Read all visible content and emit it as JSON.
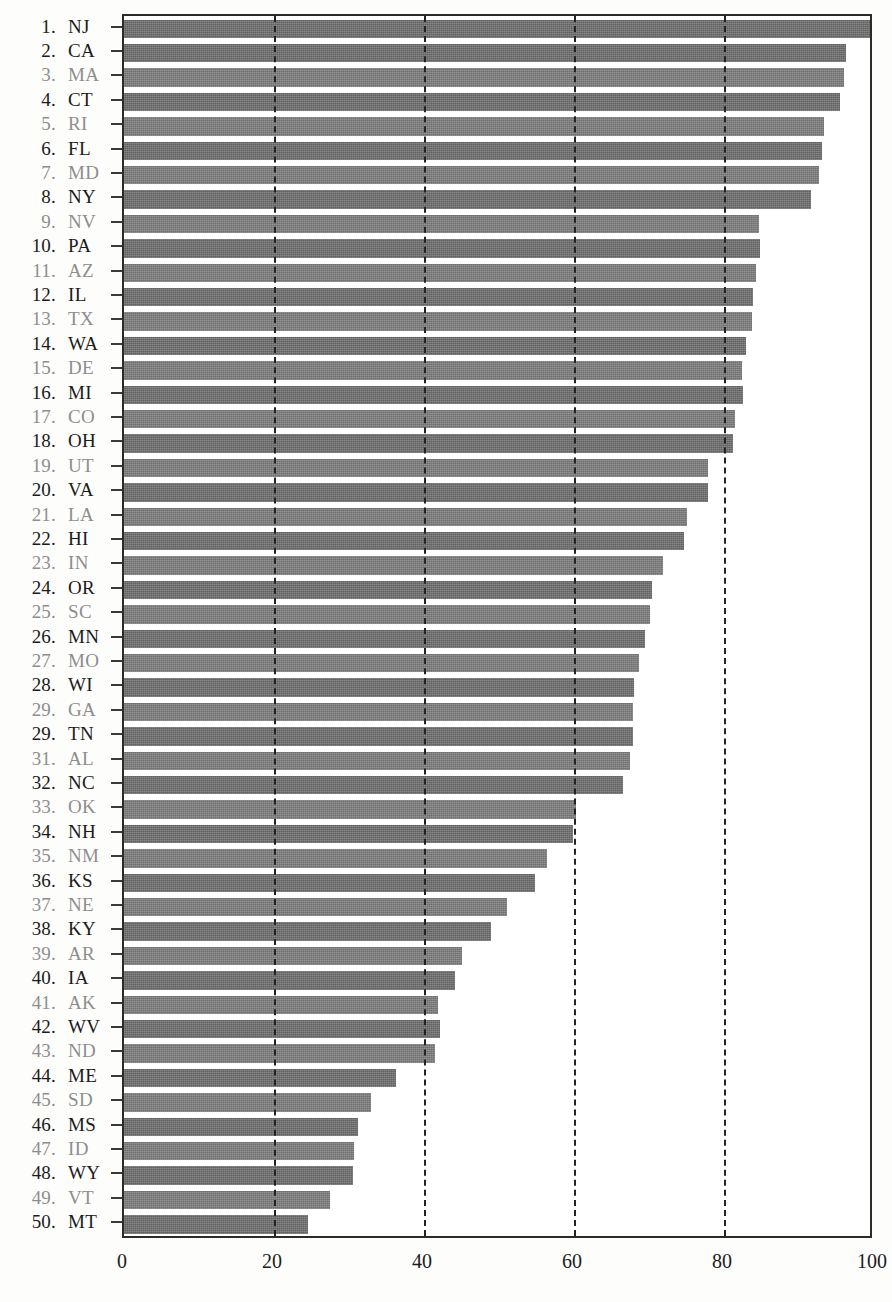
{
  "chart_data": {
    "type": "bar",
    "orientation": "horizontal",
    "title": "",
    "xlabel": "",
    "ylabel": "",
    "xlim": [
      0,
      100
    ],
    "xticks": [
      0,
      20,
      40,
      60,
      80,
      100
    ],
    "xtick_labels": [
      "0",
      "20",
      "40",
      "60",
      "80",
      "100"
    ],
    "gridlines": [
      20,
      40,
      60,
      80
    ],
    "grid": true,
    "legend": null,
    "bar_color": "#7d7d7d",
    "axis_color": "#2b2b2b",
    "categories": [
      "NJ",
      "CA",
      "MA",
      "CT",
      "RI",
      "FL",
      "MD",
      "NY",
      "NV",
      "PA",
      "AZ",
      "IL",
      "TX",
      "WA",
      "DE",
      "MI",
      "CO",
      "OH",
      "UT",
      "VA",
      "LA",
      "HI",
      "IN",
      "OR",
      "SC",
      "MN",
      "MO",
      "WI",
      "GA",
      "TN",
      "AL",
      "NC",
      "OK",
      "NH",
      "NM",
      "KS",
      "NE",
      "KY",
      "AR",
      "IA",
      "AK",
      "WV",
      "ND",
      "ME",
      "SD",
      "MS",
      "ID",
      "WY",
      "VT",
      "MT"
    ],
    "ranks": [
      "1.",
      "2.",
      "3.",
      "4.",
      "5.",
      "6.",
      "7.",
      "8.",
      "9.",
      "10.",
      "11.",
      "12.",
      "13.",
      "14.",
      "15.",
      "16.",
      "17.",
      "18.",
      "19.",
      "20.",
      "21.",
      "22.",
      "23.",
      "24.",
      "25.",
      "26.",
      "27.",
      "28.",
      "29.",
      "29.",
      "31.",
      "32.",
      "33.",
      "34.",
      "35.",
      "36.",
      "37.",
      "38.",
      "39.",
      "40.",
      "41.",
      "42.",
      "43.",
      "44.",
      "45.",
      "46.",
      "47.",
      "48.",
      "49.",
      "50."
    ],
    "values": [
      99.6,
      96.2,
      96.0,
      95.4,
      93.3,
      93.0,
      92.6,
      91.6,
      84.7,
      84.8,
      84.2,
      83.9,
      83.7,
      82.9,
      82.4,
      82.5,
      81.5,
      81.2,
      77.8,
      77.9,
      75.0,
      74.7,
      71.9,
      70.4,
      70.1,
      69.5,
      68.6,
      68.0,
      67.9,
      67.9,
      67.4,
      66.5,
      60.3,
      59.8,
      56.4,
      54.8,
      51.0,
      48.9,
      45.1,
      44.1,
      41.9,
      42.1,
      41.5,
      36.2,
      32.9,
      31.2,
      30.7,
      30.5,
      27.4,
      24.5
    ],
    "rows": [
      {
        "rank": "1.",
        "abbr": "NJ",
        "value": 99.6,
        "emphasis": "bold"
      },
      {
        "rank": "2.",
        "abbr": "CA",
        "value": 96.2,
        "emphasis": "bold"
      },
      {
        "rank": "3.",
        "abbr": "MA",
        "value": 96.0,
        "emphasis": "faint"
      },
      {
        "rank": "4.",
        "abbr": "CT",
        "value": 95.4,
        "emphasis": "bold"
      },
      {
        "rank": "5.",
        "abbr": "RI",
        "value": 93.3,
        "emphasis": "faint"
      },
      {
        "rank": "6.",
        "abbr": "FL",
        "value": 93.0,
        "emphasis": "bold"
      },
      {
        "rank": "7.",
        "abbr": "MD",
        "value": 92.6,
        "emphasis": "faint"
      },
      {
        "rank": "8.",
        "abbr": "NY",
        "value": 91.6,
        "emphasis": "bold"
      },
      {
        "rank": "9.",
        "abbr": "NV",
        "value": 84.7,
        "emphasis": "faint"
      },
      {
        "rank": "10.",
        "abbr": "PA",
        "value": 84.8,
        "emphasis": "bold"
      },
      {
        "rank": "11.",
        "abbr": "AZ",
        "value": 84.2,
        "emphasis": "faint"
      },
      {
        "rank": "12.",
        "abbr": "IL",
        "value": 83.9,
        "emphasis": "bold"
      },
      {
        "rank": "13.",
        "abbr": "TX",
        "value": 83.7,
        "emphasis": "faint"
      },
      {
        "rank": "14.",
        "abbr": "WA",
        "value": 82.9,
        "emphasis": "bold"
      },
      {
        "rank": "15.",
        "abbr": "DE",
        "value": 82.4,
        "emphasis": "faint"
      },
      {
        "rank": "16.",
        "abbr": "MI",
        "value": 82.5,
        "emphasis": "bold"
      },
      {
        "rank": "17.",
        "abbr": "CO",
        "value": 81.5,
        "emphasis": "faint"
      },
      {
        "rank": "18.",
        "abbr": "OH",
        "value": 81.2,
        "emphasis": "bold"
      },
      {
        "rank": "19.",
        "abbr": "UT",
        "value": 77.8,
        "emphasis": "faint"
      },
      {
        "rank": "20.",
        "abbr": "VA",
        "value": 77.9,
        "emphasis": "bold"
      },
      {
        "rank": "21.",
        "abbr": "LA",
        "value": 75.0,
        "emphasis": "faint"
      },
      {
        "rank": "22.",
        "abbr": "HI",
        "value": 74.7,
        "emphasis": "bold"
      },
      {
        "rank": "23.",
        "abbr": "IN",
        "value": 71.9,
        "emphasis": "faint"
      },
      {
        "rank": "24.",
        "abbr": "OR",
        "value": 70.4,
        "emphasis": "bold"
      },
      {
        "rank": "25.",
        "abbr": "SC",
        "value": 70.1,
        "emphasis": "faint"
      },
      {
        "rank": "26.",
        "abbr": "MN",
        "value": 69.5,
        "emphasis": "bold"
      },
      {
        "rank": "27.",
        "abbr": "MO",
        "value": 68.6,
        "emphasis": "faint"
      },
      {
        "rank": "28.",
        "abbr": "WI",
        "value": 68.0,
        "emphasis": "bold"
      },
      {
        "rank": "29.",
        "abbr": "GA",
        "value": 67.9,
        "emphasis": "faint"
      },
      {
        "rank": "29.",
        "abbr": "TN",
        "value": 67.9,
        "emphasis": "bold"
      },
      {
        "rank": "31.",
        "abbr": "AL",
        "value": 67.4,
        "emphasis": "faint"
      },
      {
        "rank": "32.",
        "abbr": "NC",
        "value": 66.5,
        "emphasis": "bold"
      },
      {
        "rank": "33.",
        "abbr": "OK",
        "value": 60.3,
        "emphasis": "faint"
      },
      {
        "rank": "34.",
        "abbr": "NH",
        "value": 59.8,
        "emphasis": "bold"
      },
      {
        "rank": "35.",
        "abbr": "NM",
        "value": 56.4,
        "emphasis": "faint"
      },
      {
        "rank": "36.",
        "abbr": "KS",
        "value": 54.8,
        "emphasis": "bold"
      },
      {
        "rank": "37.",
        "abbr": "NE",
        "value": 51.0,
        "emphasis": "faint"
      },
      {
        "rank": "38.",
        "abbr": "KY",
        "value": 48.9,
        "emphasis": "bold"
      },
      {
        "rank": "39.",
        "abbr": "AR",
        "value": 45.1,
        "emphasis": "faint"
      },
      {
        "rank": "40.",
        "abbr": "IA",
        "value": 44.1,
        "emphasis": "bold"
      },
      {
        "rank": "41.",
        "abbr": "AK",
        "value": 41.9,
        "emphasis": "faint"
      },
      {
        "rank": "42.",
        "abbr": "WV",
        "value": 42.1,
        "emphasis": "bold"
      },
      {
        "rank": "43.",
        "abbr": "ND",
        "value": 41.5,
        "emphasis": "faint"
      },
      {
        "rank": "44.",
        "abbr": "ME",
        "value": 36.2,
        "emphasis": "bold"
      },
      {
        "rank": "45.",
        "abbr": "SD",
        "value": 32.9,
        "emphasis": "faint"
      },
      {
        "rank": "46.",
        "abbr": "MS",
        "value": 31.2,
        "emphasis": "bold"
      },
      {
        "rank": "47.",
        "abbr": "ID",
        "value": 30.7,
        "emphasis": "faint"
      },
      {
        "rank": "48.",
        "abbr": "WY",
        "value": 30.5,
        "emphasis": "bold"
      },
      {
        "rank": "49.",
        "abbr": "VT",
        "value": 27.4,
        "emphasis": "faint"
      },
      {
        "rank": "50.",
        "abbr": "MT",
        "value": 24.5,
        "emphasis": "bold"
      }
    ]
  }
}
